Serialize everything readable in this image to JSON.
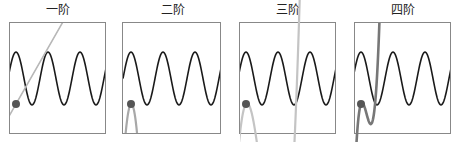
{
  "panels": [
    {
      "title": "一阶",
      "order": 1,
      "approx_color": "#b8b8b8",
      "approx_width": 1.6
    },
    {
      "title": "二阶",
      "order": 2,
      "approx_color": "#a8a8a8",
      "approx_width": 2.2
    },
    {
      "title": "三阶",
      "order": 3,
      "approx_color": "#c4c4c4",
      "approx_width": 2.2
    },
    {
      "title": "四阶",
      "order": 4,
      "approx_color": "#777777",
      "approx_width": 2.6
    }
  ],
  "colors": {
    "sine": "#1a1a1a",
    "frame": "#888888",
    "point": "#555555"
  }
}
